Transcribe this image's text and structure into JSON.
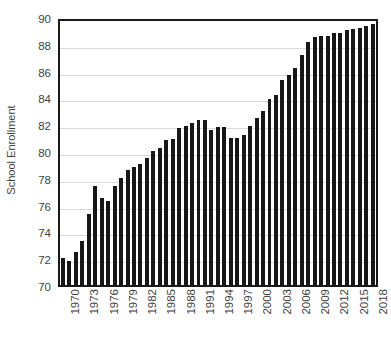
{
  "chart_data": {
    "type": "bar",
    "title": "",
    "xlabel": "",
    "ylabel": "School Enrollment",
    "ylim": [
      70,
      90
    ],
    "y_ticks": [
      70,
      72,
      74,
      76,
      78,
      80,
      82,
      84,
      86,
      88,
      90
    ],
    "x_tick_labels": [
      "1970",
      "1973",
      "1976",
      "1979",
      "1982",
      "1985",
      "1988",
      "1991",
      "1994",
      "1997",
      "2000",
      "2003",
      "2006",
      "2009",
      "2012",
      "2015",
      "2018"
    ],
    "grid": "horizontal",
    "legend": "none",
    "bar_color": "#171717",
    "categories": [
      "1970",
      "1971",
      "1972",
      "1973",
      "1974",
      "1975",
      "1976",
      "1977",
      "1978",
      "1979",
      "1980",
      "1981",
      "1982",
      "1983",
      "1984",
      "1985",
      "1986",
      "1987",
      "1988",
      "1989",
      "1990",
      "1991",
      "1992",
      "1993",
      "1994",
      "1995",
      "1996",
      "1997",
      "1998",
      "1999",
      "2000",
      "2001",
      "2002",
      "2003",
      "2004",
      "2005",
      "2006",
      "2007",
      "2008",
      "2009",
      "2010",
      "2011",
      "2012",
      "2013",
      "2014",
      "2015",
      "2016",
      "2017",
      "2018"
    ],
    "values": [
      72.0,
      71.8,
      72.5,
      73.3,
      75.3,
      77.4,
      76.5,
      76.3,
      77.4,
      78.0,
      78.6,
      78.8,
      79.0,
      79.5,
      80.0,
      80.2,
      80.8,
      80.9,
      81.7,
      81.9,
      82.1,
      82.3,
      82.3,
      81.6,
      81.8,
      81.8,
      81.0,
      81.0,
      81.2,
      81.9,
      82.5,
      83.0,
      83.9,
      84.2,
      85.3,
      85.7,
      86.2,
      87.2,
      88.1,
      88.5,
      88.6,
      88.6,
      88.8,
      88.8,
      89.0,
      89.1,
      89.2,
      89.3,
      89.5
    ]
  }
}
